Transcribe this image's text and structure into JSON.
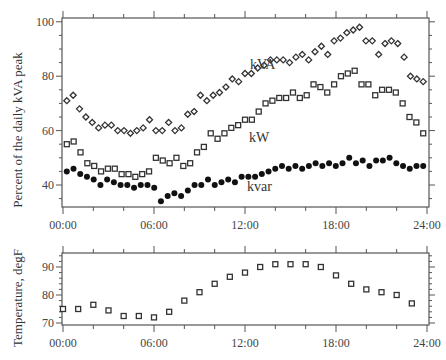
{
  "chart_data": [
    {
      "type": "scatter",
      "title": "",
      "xlabel": "",
      "ylabel": "Percent of the daily kVA peak",
      "x_ticks": [
        "00:00",
        "06:00",
        "12:00",
        "18:00",
        "24:00"
      ],
      "y_ticks": [
        40,
        60,
        80,
        100
      ],
      "ylim": [
        30,
        102
      ],
      "xlim_hours": [
        0,
        24
      ],
      "grid": false,
      "legend": "inline labels",
      "x_hours": [
        0.25,
        0.75,
        1.25,
        1.75,
        2.25,
        2.75,
        3.25,
        3.75,
        4.25,
        4.75,
        5.25,
        5.75,
        6.25,
        6.75,
        7.25,
        7.75,
        8.25,
        8.75,
        9.25,
        9.75,
        10.25,
        10.75,
        11.25,
        11.75,
        12.25,
        12.75,
        13.25,
        13.75,
        14.25,
        14.75,
        15.25,
        15.75,
        16.25,
        16.75,
        17.25,
        17.75,
        18.25,
        18.75,
        19.25,
        19.75,
        20.25,
        20.75,
        21.25,
        21.75,
        22.25,
        22.75,
        23.25,
        23.75
      ],
      "series": [
        {
          "name": "kVA",
          "marker": "diamond-open",
          "values": [
            71,
            73,
            68,
            65,
            63,
            61,
            62,
            62,
            60,
            60,
            59,
            60,
            61,
            64,
            60,
            60,
            63,
            60,
            61,
            66,
            67,
            73,
            71,
            73,
            74,
            76,
            79,
            78,
            81,
            81,
            83,
            84,
            86,
            86,
            86,
            85,
            87,
            88,
            86,
            89,
            91,
            88,
            93,
            94,
            96,
            97,
            98,
            93,
            93,
            88,
            92,
            93,
            92,
            87,
            80,
            79,
            78
          ],
          "labeled_at": "kVA"
        },
        {
          "name": "kW",
          "marker": "square-open",
          "values": [
            55,
            56,
            52,
            48,
            47,
            45,
            46,
            46,
            44,
            44,
            43,
            44,
            45,
            50,
            49,
            48,
            50,
            47,
            48,
            52,
            54,
            59,
            57,
            59,
            61,
            62,
            64,
            64,
            67,
            70,
            71,
            72,
            72,
            74,
            72,
            73,
            77,
            76,
            74,
            77,
            80,
            81,
            82,
            77,
            77,
            73,
            75,
            75,
            74,
            70,
            65,
            63,
            59
          ]
        },
        {
          "name": "kvar",
          "marker": "circle-filled",
          "values": [
            45,
            46,
            44,
            43,
            42,
            40,
            42,
            41,
            40,
            40,
            39,
            40,
            40,
            39,
            34,
            36,
            37,
            36,
            38,
            40,
            40,
            42,
            40,
            41,
            42,
            41,
            43,
            43,
            43,
            44,
            45,
            46,
            47,
            46,
            47,
            46,
            47,
            48,
            47,
            48,
            47,
            48,
            50,
            48,
            49,
            47,
            49,
            49,
            50,
            48,
            47,
            46,
            47,
            47
          ]
        }
      ],
      "annotations": [
        "kVA",
        "kW",
        "kvar"
      ]
    },
    {
      "type": "scatter",
      "title": "",
      "xlabel": "",
      "ylabel": "Temperature, degF",
      "x_ticks": [
        "00:00",
        "06:00",
        "12:00",
        "18:00",
        "24:00"
      ],
      "y_ticks": [
        70,
        80,
        90
      ],
      "ylim": [
        69,
        95
      ],
      "grid": false,
      "x_hours": [
        0,
        1,
        2,
        3,
        4,
        5,
        6,
        7,
        8,
        9,
        10,
        11,
        12,
        13,
        14,
        15,
        16,
        17,
        18,
        19,
        20,
        21,
        22,
        23
      ],
      "series": [
        {
          "name": "Temperature",
          "marker": "square-open",
          "values": [
            75,
            75,
            76.5,
            74.5,
            72.5,
            72.5,
            72,
            74,
            78,
            81,
            84,
            86.5,
            88,
            90,
            91,
            91,
            91,
            90,
            87,
            84,
            82,
            81,
            80,
            77
          ]
        }
      ]
    }
  ],
  "labels": {
    "main_ylabel": "Percent of the daily kVA peak",
    "temp_ylabel": "Temperature, degF",
    "kva": "kVA",
    "kw": "kW",
    "kvar": "kvar"
  }
}
